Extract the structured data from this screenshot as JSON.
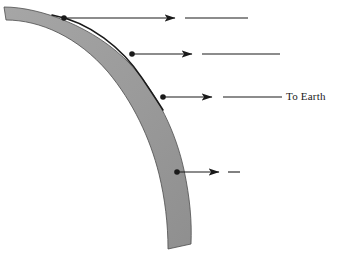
{
  "figure": {
    "background_color": "#ffffff",
    "width": 343,
    "height": 260
  },
  "band": {
    "name": "curved-arc-band",
    "fill_color": "#9a9a9a",
    "stroke_color": "#4d4d4d",
    "inner_curve_color": "#1a1a1a",
    "description": "Thick curved crescent band sweeping from upper-left down to lower-center"
  },
  "labels": {
    "to_earth": "To Earth"
  },
  "arrows": [
    {
      "id": "arrow-1",
      "label": "",
      "y": 18,
      "dot_x": 64,
      "head_x": 175,
      "tail_start_x": 185,
      "tail_end_x": 248,
      "color": "#1a1a1a"
    },
    {
      "id": "arrow-2",
      "label": "",
      "y": 54,
      "dot_x": 132,
      "head_x": 192,
      "tail_start_x": 202,
      "tail_end_x": 280,
      "color": "#1a1a1a"
    },
    {
      "id": "arrow-3",
      "label": "To Earth",
      "y": 97,
      "dot_x": 163,
      "head_x": 212,
      "tail_start_x": 223,
      "tail_end_x": 282,
      "color": "#1a1a1a"
    },
    {
      "id": "arrow-4",
      "label": "",
      "y": 172,
      "dot_x": 177,
      "head_x": 219,
      "tail_start_x": 228,
      "tail_end_x": 240,
      "color": "#1a1a1a"
    }
  ],
  "colors": {
    "ink": "#1a1a1a",
    "band_fill": "#9a9a9a",
    "band_edge": "#4d4d4d",
    "background": "#ffffff"
  }
}
